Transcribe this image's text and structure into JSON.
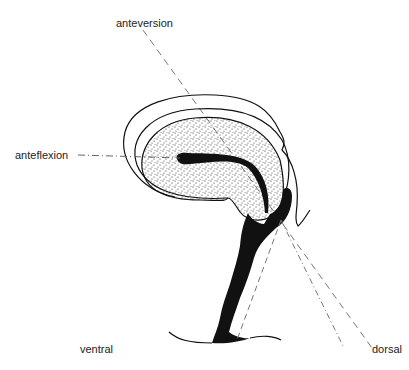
{
  "diagram": {
    "labels": {
      "anteversion": "anteversion",
      "anteflexion": "anteflexion",
      "ventral": "ventral",
      "dorsal": "dorsal"
    },
    "colors": {
      "ink": "#111111",
      "guide_line": "#777777",
      "background": "#ffffff"
    }
  }
}
